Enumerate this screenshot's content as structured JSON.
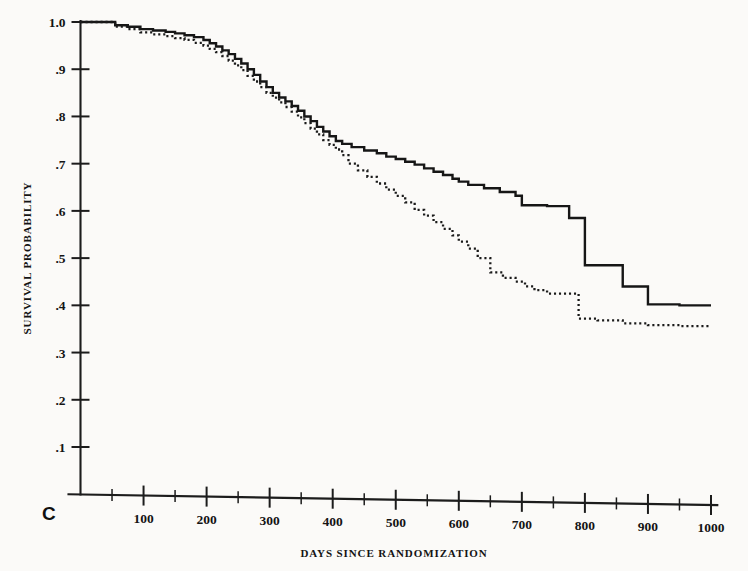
{
  "figure": {
    "panel_label": "C",
    "background_color": "#fbfaf8",
    "ink_color": "#161616"
  },
  "chart_data": {
    "type": "line",
    "title": "",
    "subtitle": "",
    "xlabel": "DAYS SINCE RANDOMIZATION",
    "ylabel": "SURVIVAL PROBABILITY",
    "xlim": [
      0,
      1030
    ],
    "ylim": [
      0,
      1.0
    ],
    "grid": false,
    "legend_position": "none",
    "x_ticks_major": [
      100,
      200,
      300,
      400,
      500,
      600,
      700,
      800,
      900,
      1000
    ],
    "x_ticklabels": [
      "100",
      "200",
      "300",
      "400",
      "500",
      "600",
      "700",
      "800",
      "900",
      "1000"
    ],
    "x_ticks_minor": [
      50,
      150,
      250,
      350,
      450,
      550,
      650,
      750,
      850,
      950
    ],
    "y_ticks_major": [
      0.1,
      0.2,
      0.3,
      0.4,
      0.5,
      0.6,
      0.7,
      0.8,
      0.9,
      1.0
    ],
    "y_ticklabels": [
      ".1",
      ".2",
      ".3",
      ".4",
      ".5",
      ".6",
      ".7",
      ".8",
      ".9",
      "1.0"
    ],
    "series": [
      {
        "name": "treatment-solid",
        "style": "solid",
        "step": "post",
        "x": [
          0,
          30,
          55,
          75,
          95,
          115,
          135,
          150,
          165,
          180,
          195,
          205,
          215,
          225,
          235,
          245,
          255,
          265,
          275,
          285,
          295,
          305,
          315,
          325,
          335,
          345,
          355,
          365,
          375,
          385,
          395,
          405,
          415,
          430,
          450,
          470,
          485,
          500,
          515,
          530,
          545,
          560,
          575,
          590,
          600,
          615,
          640,
          665,
          690,
          700,
          720,
          740,
          760,
          775,
          790,
          800,
          820,
          860,
          900,
          950,
          1000
        ],
        "y": [
          1.0,
          1.0,
          0.993,
          0.99,
          0.985,
          0.982,
          0.979,
          0.976,
          0.972,
          0.968,
          0.962,
          0.955,
          0.948,
          0.94,
          0.932,
          0.922,
          0.912,
          0.9,
          0.888,
          0.874,
          0.862,
          0.85,
          0.84,
          0.832,
          0.822,
          0.812,
          0.8,
          0.79,
          0.778,
          0.768,
          0.758,
          0.748,
          0.742,
          0.735,
          0.728,
          0.722,
          0.715,
          0.71,
          0.704,
          0.698,
          0.69,
          0.683,
          0.676,
          0.668,
          0.662,
          0.655,
          0.648,
          0.64,
          0.632,
          0.612,
          0.612,
          0.61,
          0.61,
          0.585,
          0.585,
          0.485,
          0.485,
          0.44,
          0.402,
          0.4,
          0.4
        ]
      },
      {
        "name": "control-dotted",
        "style": "dotted",
        "step": "post",
        "x": [
          0,
          30,
          55,
          75,
          95,
          115,
          135,
          150,
          165,
          180,
          195,
          205,
          215,
          225,
          235,
          245,
          255,
          265,
          275,
          285,
          295,
          305,
          315,
          325,
          335,
          345,
          355,
          365,
          375,
          385,
          395,
          405,
          415,
          425,
          440,
          455,
          470,
          485,
          500,
          515,
          530,
          545,
          560,
          575,
          590,
          600,
          615,
          630,
          650,
          670,
          690,
          705,
          720,
          740,
          760,
          790,
          820,
          860,
          900,
          950,
          1000
        ],
        "y": [
          1.0,
          1.0,
          0.99,
          0.985,
          0.978,
          0.974,
          0.97,
          0.966,
          0.962,
          0.956,
          0.95,
          0.943,
          0.936,
          0.928,
          0.918,
          0.908,
          0.898,
          0.886,
          0.874,
          0.862,
          0.85,
          0.84,
          0.83,
          0.82,
          0.81,
          0.798,
          0.786,
          0.774,
          0.762,
          0.75,
          0.74,
          0.73,
          0.718,
          0.7,
          0.686,
          0.672,
          0.658,
          0.645,
          0.632,
          0.618,
          0.602,
          0.59,
          0.576,
          0.562,
          0.548,
          0.535,
          0.52,
          0.5,
          0.47,
          0.458,
          0.45,
          0.44,
          0.432,
          0.425,
          0.425,
          0.372,
          0.368,
          0.362,
          0.358,
          0.356,
          0.355
        ]
      }
    ]
  }
}
